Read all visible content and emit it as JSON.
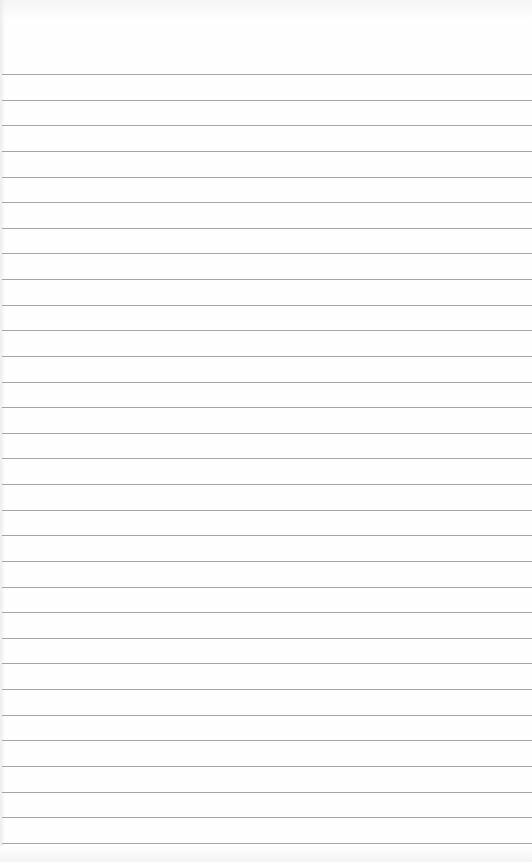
{
  "paper": {
    "type": "lined-notepad",
    "background": "#fefefe",
    "rule_color": "#a5a5a5",
    "first_rule_y": 74,
    "rule_spacing": 25.63,
    "rule_count": 31,
    "text": ""
  }
}
